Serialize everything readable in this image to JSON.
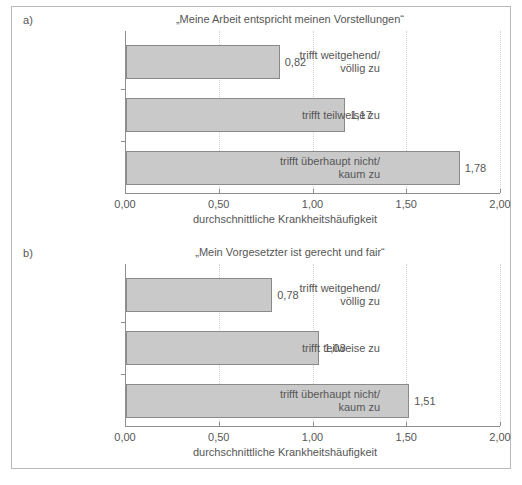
{
  "figure": {
    "panels": [
      {
        "letter": "a)",
        "title": "„Meine Arbeit entspricht meinen Vorstellungen“",
        "axis_caption": "durchschnittliche Krankheitshäufigkeit",
        "categories": [
          "trifft weitgehend/\nvöllig zu",
          "trifft teilweise zu",
          "trifft überhaupt nicht/\nkaum zu"
        ],
        "value_labels": [
          "0,82",
          "1,17",
          "1,78"
        ],
        "tick_labels": [
          "0,00",
          "0,50",
          "1,00",
          "1,50",
          "2,00"
        ]
      },
      {
        "letter": "b)",
        "title": "„Mein Vorgesetzter ist gerecht und fair“",
        "axis_caption": "durchschnittliche Krankheitshäufigkeit",
        "categories": [
          "trifft weitgehend/\nvöllig zu",
          "trifft teilweise zu",
          "trifft überhaupt nicht/\nkaum zu"
        ],
        "value_labels": [
          "0,78",
          "1,03",
          "1,51"
        ],
        "tick_labels": [
          "0,00",
          "0,50",
          "1,00",
          "1,50",
          "2,00"
        ]
      }
    ],
    "colors": {
      "bar_fill": "#c9c9c9",
      "bar_stroke": "#8a8a8a",
      "axis": "#8e8e8e",
      "grid": "#cfcfcf",
      "text": "#565656",
      "frame": "#b9b9b9"
    }
  },
  "chart_data": [
    {
      "type": "bar",
      "orientation": "horizontal",
      "panel": "a)",
      "title": "„Meine Arbeit entspricht meinen Vorstellungen“",
      "categories": [
        "trifft weitgehend/völlig zu",
        "trifft teilweise zu",
        "trifft überhaupt nicht/kaum zu"
      ],
      "values": [
        0.82,
        1.17,
        1.78
      ],
      "data_labels": [
        "0,82",
        "1,17",
        "1,78"
      ],
      "xlabel": "durchschnittliche Krankheitshäufigkeit",
      "ylabel": "",
      "xlim": [
        0,
        2
      ],
      "xticks": [
        0,
        0.5,
        1,
        1.5,
        2
      ],
      "xtick_labels": [
        "0,00",
        "0,50",
        "1,00",
        "1,50",
        "2,00"
      ],
      "grid": "vertical-dotted",
      "legend": "none"
    },
    {
      "type": "bar",
      "orientation": "horizontal",
      "panel": "b)",
      "title": "„Mein Vorgesetzter ist gerecht und fair“",
      "categories": [
        "trifft weitgehend/völlig zu",
        "trifft teilweise zu",
        "trifft überhaupt nicht/kaum zu"
      ],
      "values": [
        0.78,
        1.03,
        1.51
      ],
      "data_labels": [
        "0,78",
        "1,03",
        "1,51"
      ],
      "xlabel": "durchschnittliche Krankheitshäufigkeit",
      "ylabel": "",
      "xlim": [
        0,
        2
      ],
      "xticks": [
        0,
        0.5,
        1,
        1.5,
        2
      ],
      "xtick_labels": [
        "0,00",
        "0,50",
        "1,00",
        "1,50",
        "2,00"
      ],
      "grid": "vertical-dotted",
      "legend": "none"
    }
  ]
}
